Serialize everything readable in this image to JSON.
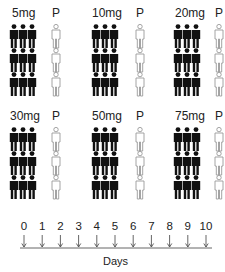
{
  "dose_groups": [
    {
      "dose": "5mg",
      "placebo": "P",
      "x": 12,
      "px": 51,
      "y": 6
    },
    {
      "dose": "10mg",
      "placebo": "P",
      "x": 92,
      "px": 135,
      "y": 6
    },
    {
      "dose": "20mg",
      "placebo": "P",
      "x": 174,
      "px": 214,
      "y": 6
    },
    {
      "dose": "30mg",
      "placebo": "P",
      "x": 10,
      "px": 51,
      "y": 109
    },
    {
      "dose": "50mg",
      "placebo": "P",
      "x": 92,
      "px": 135,
      "y": 109
    },
    {
      "dose": "75mg",
      "placebo": "P",
      "x": 174,
      "px": 214,
      "y": 109
    }
  ],
  "icons": {
    "treated": "person-group-filled-icon",
    "placebo": "person-outline-icon",
    "treated_color": "#111111",
    "placebo_stroke": "#9a9a9a"
  },
  "timeline": {
    "ticks": [
      "0",
      "1",
      "2",
      "3",
      "4",
      "5",
      "6",
      "7",
      "8",
      "9",
      "10"
    ],
    "axis_label": "Days"
  }
}
